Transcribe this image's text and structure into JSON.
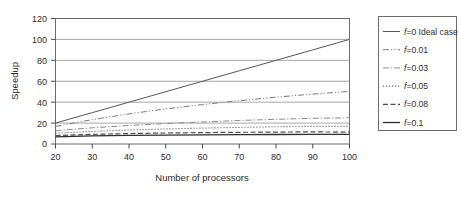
{
  "chart_data": {
    "type": "line",
    "title": "",
    "xlabel": "Number of processors",
    "ylabel": "Speedup",
    "xlim": [
      20,
      100
    ],
    "ylim": [
      0,
      120
    ],
    "xticks": [
      20,
      30,
      40,
      50,
      60,
      70,
      80,
      90,
      100
    ],
    "yticks": [
      0,
      20,
      40,
      60,
      80,
      100,
      120
    ],
    "grid": "horizontal",
    "legend_position": "right-outside",
    "x": [
      20,
      30,
      40,
      50,
      60,
      70,
      80,
      90,
      100
    ],
    "series": [
      {
        "name": "f=0 Ideal case",
        "label_prefix": "f",
        "label_suffix": "=0 Ideal case",
        "style": "solid",
        "color": "#555555",
        "values": [
          20,
          30,
          40,
          50,
          60,
          70,
          80,
          90,
          100
        ]
      },
      {
        "name": "f=0.01",
        "label_prefix": "f",
        "label_suffix": "=0.01",
        "style": "dash-dot-dot",
        "color": "#7a7a7a",
        "values": [
          16.8,
          23.3,
          28.8,
          33.6,
          37.7,
          41.4,
          44.8,
          47.7,
          50.3
        ]
      },
      {
        "name": "f=0.03",
        "label_prefix": "f",
        "label_suffix": "=0.03",
        "style": "dash-dot",
        "color": "#8a8a8a",
        "values": [
          12.7,
          15.5,
          17.7,
          19.6,
          21.1,
          22.5,
          23.6,
          24.6,
          25.1
        ]
      },
      {
        "name": "f=0.05",
        "label_prefix": "f",
        "label_suffix": "=0.05",
        "style": "dotted",
        "color": "#6a6a6a",
        "values": [
          10.3,
          12.0,
          13.4,
          14.4,
          15.2,
          15.9,
          16.5,
          16.9,
          16.8
        ]
      },
      {
        "name": "f=0.08",
        "label_prefix": "f",
        "label_suffix": "=0.08",
        "style": "dashed",
        "color": "#4d4d4d",
        "values": [
          8.1,
          9.2,
          10.0,
          10.5,
          10.9,
          11.2,
          11.4,
          11.6,
          11.3
        ]
      },
      {
        "name": "f=0.1",
        "label_prefix": "f",
        "label_suffix": "=0.1",
        "style": "solid-thick",
        "color": "#2e2e2e",
        "values": [
          6.9,
          7.7,
          8.2,
          8.5,
          8.8,
          9.0,
          9.1,
          9.2,
          9.2
        ]
      }
    ]
  },
  "axes": {
    "ylabel": "Speedup",
    "xlabel": "Number of processors",
    "yticks": [
      "120",
      "100",
      "80",
      "60",
      "40",
      "20",
      "0"
    ],
    "xticks": [
      "20",
      "30",
      "40",
      "50",
      "60",
      "70",
      "80",
      "90",
      "100"
    ]
  },
  "legend": {
    "items": [
      {
        "label": "f=0 Ideal case"
      },
      {
        "label": "f=0.01"
      },
      {
        "label": "f=0.03"
      },
      {
        "label": "f=0.05"
      },
      {
        "label": "f=0.08"
      },
      {
        "label": "f=0.1"
      }
    ]
  },
  "colors": {
    "axis": "#4a4a4a",
    "grid": "#8f8f8f",
    "frame": "#6b6b6b",
    "text": "#2b2b2b",
    "background": "#ffffff"
  }
}
